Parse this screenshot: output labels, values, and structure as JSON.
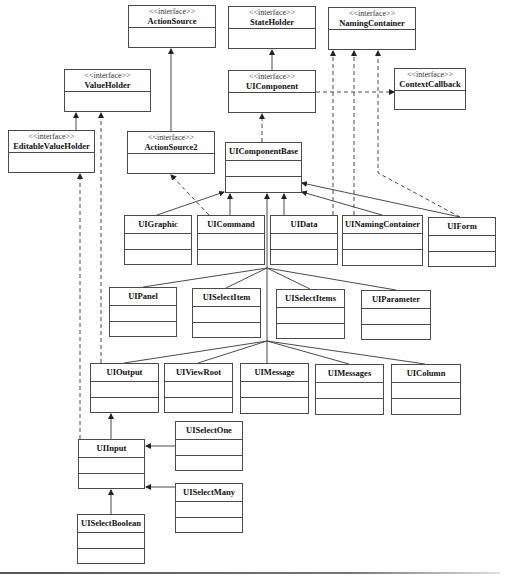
{
  "diagram": {
    "type": "uml-class-diagram",
    "stereotype_label": "<<interface>>",
    "colors": {
      "line": "#4a4a4a",
      "box_border": "#4a4a4a",
      "background": "#ffffff"
    },
    "classes": [
      {
        "id": "ActionSource",
        "name": "ActionSource",
        "interface": true,
        "x": 128,
        "y": 5,
        "w": 88,
        "h": 43
      },
      {
        "id": "StateHolder",
        "name": "StateHolder",
        "interface": true,
        "x": 228,
        "y": 6,
        "w": 88,
        "h": 43
      },
      {
        "id": "NamingContainer",
        "name": "NamingContainer",
        "interface": true,
        "x": 328,
        "y": 7,
        "w": 88,
        "h": 43
      },
      {
        "id": "ValueHolder",
        "name": "ValueHolder",
        "interface": true,
        "x": 64,
        "y": 69,
        "w": 87,
        "h": 43
      },
      {
        "id": "UIComponent",
        "name": "UIComponent",
        "interface": true,
        "x": 228,
        "y": 70,
        "w": 88,
        "h": 43
      },
      {
        "id": "ContextCallback",
        "name": "ContextCallback",
        "interface": true,
        "x": 394,
        "y": 68,
        "w": 72,
        "h": 42
      },
      {
        "id": "EditableValueHolder",
        "name": "EditableValueHolder",
        "interface": true,
        "x": 8,
        "y": 130,
        "w": 87,
        "h": 43
      },
      {
        "id": "ActionSource2",
        "name": "ActionSource2",
        "interface": true,
        "x": 127,
        "y": 131,
        "w": 88,
        "h": 43
      },
      {
        "id": "UIComponentBase",
        "name": "UIComponentBase",
        "interface": false,
        "x": 225,
        "y": 142,
        "w": 77,
        "h": 51
      },
      {
        "id": "UIGraphic",
        "name": "UIGraphic",
        "interface": false,
        "x": 124,
        "y": 215,
        "w": 68,
        "h": 50
      },
      {
        "id": "UICommand",
        "name": "UICommand",
        "interface": false,
        "x": 197,
        "y": 215,
        "w": 68,
        "h": 50
      },
      {
        "id": "UIData",
        "name": "UIData",
        "interface": false,
        "x": 270,
        "y": 215,
        "w": 68,
        "h": 50
      },
      {
        "id": "UINamingContainer",
        "name": "UINamingContainer",
        "interface": false,
        "x": 342,
        "y": 215,
        "w": 81,
        "h": 51
      },
      {
        "id": "UIForm",
        "name": "UIForm",
        "interface": false,
        "x": 428,
        "y": 217,
        "w": 68,
        "h": 50
      },
      {
        "id": "UIPanel",
        "name": "UIPanel",
        "interface": false,
        "x": 109,
        "y": 287,
        "w": 68,
        "h": 50
      },
      {
        "id": "UISelectItem",
        "name": "UISelectItem",
        "interface": false,
        "x": 192,
        "y": 288,
        "w": 69,
        "h": 50
      },
      {
        "id": "UISelectItems",
        "name": "UISelectItems",
        "interface": false,
        "x": 276,
        "y": 289,
        "w": 69,
        "h": 50
      },
      {
        "id": "UIParameter",
        "name": "UIParameter",
        "interface": false,
        "x": 361,
        "y": 290,
        "w": 70,
        "h": 50
      },
      {
        "id": "UIOutput",
        "name": "UIOutput",
        "interface": false,
        "x": 90,
        "y": 363,
        "w": 69,
        "h": 50
      },
      {
        "id": "UIViewRoot",
        "name": "UIViewRoot",
        "interface": false,
        "x": 164,
        "y": 363,
        "w": 69,
        "h": 50
      },
      {
        "id": "UIMessage",
        "name": "UIMessage",
        "interface": false,
        "x": 240,
        "y": 363,
        "w": 69,
        "h": 51
      },
      {
        "id": "UIMessages",
        "name": "UIMessages",
        "interface": false,
        "x": 315,
        "y": 364,
        "w": 69,
        "h": 51
      },
      {
        "id": "UIColumn",
        "name": "UIColumn",
        "interface": false,
        "x": 391,
        "y": 364,
        "w": 70,
        "h": 51
      },
      {
        "id": "UISelectOne",
        "name": "UISelectOne",
        "interface": false,
        "x": 175,
        "y": 421,
        "w": 68,
        "h": 50
      },
      {
        "id": "UIInput",
        "name": "UIInput",
        "interface": false,
        "x": 78,
        "y": 439,
        "w": 67,
        "h": 50
      },
      {
        "id": "UISelectMany",
        "name": "UISelectMany",
        "interface": false,
        "x": 175,
        "y": 483,
        "w": 68,
        "h": 50
      },
      {
        "id": "UISelectBoolean",
        "name": "UISelectBoolean",
        "interface": false,
        "x": 77,
        "y": 514,
        "w": 68,
        "h": 50
      }
    ],
    "relationships": [
      {
        "from": "StateHolder",
        "to": "UIComponent",
        "kind": "generalization",
        "style": "solid",
        "points": [
          [
            272,
            113
          ],
          [
            272,
            50
          ]
        ]
      },
      {
        "from": "UIComponent",
        "to": "ContextCallback",
        "kind": "realization",
        "style": "dashed",
        "points": [
          [
            316,
            92
          ],
          [
            394,
            92
          ]
        ]
      },
      {
        "from": "UIComponentBase",
        "to": "UIComponent",
        "kind": "realization",
        "style": "dashed",
        "points": [
          [
            262,
            142
          ],
          [
            262,
            114
          ]
        ]
      },
      {
        "from": "EditableValueHolder",
        "to": "ValueHolder",
        "kind": "generalization",
        "style": "solid",
        "points": [
          [
            76,
            130
          ],
          [
            76,
            113
          ]
        ]
      },
      {
        "from": "ActionSource2",
        "to": "ActionSource",
        "kind": "generalization",
        "style": "solid",
        "points": [
          [
            171,
            131
          ],
          [
            171,
            49
          ]
        ]
      },
      {
        "from": "UIOutput",
        "to": "ValueHolder",
        "kind": "realization",
        "style": "dashed",
        "points": [
          [
            101,
            363
          ],
          [
            101,
            113
          ]
        ]
      },
      {
        "from": "UIInput",
        "to": "EditableValueHolder",
        "kind": "realization",
        "style": "dashed",
        "points": [
          [
            80,
            439
          ],
          [
            80,
            174
          ]
        ]
      },
      {
        "from": "UICommand",
        "to": "ActionSource2",
        "kind": "realization",
        "style": "dashed",
        "points": [
          [
            209,
            215
          ],
          [
            171,
            175
          ]
        ]
      },
      {
        "from": "UIData",
        "to": "NamingContainer",
        "kind": "realization",
        "style": "dashed",
        "points": [
          [
            333,
            215
          ],
          [
            333,
            51
          ]
        ]
      },
      {
        "from": "UINamingContainer",
        "to": "NamingContainer",
        "kind": "realization",
        "style": "dashed",
        "points": [
          [
            354,
            215
          ],
          [
            354,
            51
          ]
        ]
      },
      {
        "from": "UIForm",
        "to": "NamingContainer",
        "kind": "realization",
        "style": "dashed",
        "points": [
          [
            460,
            217
          ],
          [
            378,
            173
          ],
          [
            378,
            51
          ]
        ]
      },
      {
        "from": "UIGraphic",
        "to": "UIComponentBase",
        "kind": "generalization",
        "style": "solid",
        "points": [
          [
            157,
            215
          ],
          [
            224,
            192
          ]
        ]
      },
      {
        "from": "UICommand",
        "to": "UIComponentBase",
        "kind": "generalization",
        "style": "solid",
        "points": [
          [
            230,
            215
          ],
          [
            230,
            194
          ]
        ]
      },
      {
        "from": "UIData",
        "to": "UIComponentBase",
        "kind": "generalization",
        "style": "solid",
        "points": [
          [
            284,
            215
          ],
          [
            284,
            194
          ]
        ]
      },
      {
        "from": "UINamingContainer",
        "to": "UIComponentBase",
        "kind": "generalization",
        "style": "solid",
        "points": [
          [
            382,
            215
          ],
          [
            302,
            192
          ]
        ]
      },
      {
        "from": "UIForm",
        "to": "UIComponentBase",
        "kind": "generalization",
        "style": "solid",
        "points": [
          [
            460,
            217
          ],
          [
            302,
            183
          ]
        ]
      },
      {
        "from": "trunk",
        "to": "UIComponentBase",
        "kind": "generalization",
        "style": "solid",
        "points": [
          [
            267,
            341
          ],
          [
            267,
            194
          ]
        ]
      },
      {
        "from": "UIPanel",
        "to": "trunk",
        "kind": "generalization",
        "style": "solid",
        "points": [
          [
            143,
            287
          ],
          [
            267,
            268
          ]
        ]
      },
      {
        "from": "UISelectItem",
        "to": "trunk",
        "kind": "generalization",
        "style": "solid",
        "points": [
          [
            226,
            288
          ],
          [
            267,
            268
          ]
        ]
      },
      {
        "from": "UISelectItems",
        "to": "trunk",
        "kind": "generalization",
        "style": "solid",
        "points": [
          [
            310,
            289
          ],
          [
            267,
            268
          ]
        ]
      },
      {
        "from": "UIParameter",
        "to": "trunk",
        "kind": "generalization",
        "style": "solid",
        "points": [
          [
            396,
            290
          ],
          [
            267,
            268
          ]
        ]
      },
      {
        "from": "UIOutput",
        "to": "trunk",
        "kind": "generalization",
        "style": "solid",
        "points": [
          [
            124,
            363
          ],
          [
            267,
            341
          ]
        ]
      },
      {
        "from": "UIViewRoot",
        "to": "trunk",
        "kind": "generalization",
        "style": "solid",
        "points": [
          [
            198,
            363
          ],
          [
            267,
            341
          ]
        ]
      },
      {
        "from": "UIMessage",
        "to": "trunk",
        "kind": "generalization",
        "style": "solid",
        "points": [
          [
            267,
            363
          ],
          [
            267,
            341
          ]
        ]
      },
      {
        "from": "UIMessages",
        "to": "trunk",
        "kind": "generalization",
        "style": "solid",
        "points": [
          [
            349,
            364
          ],
          [
            267,
            341
          ]
        ]
      },
      {
        "from": "UIColumn",
        "to": "trunk",
        "kind": "generalization",
        "style": "solid",
        "points": [
          [
            425,
            364
          ],
          [
            267,
            341
          ]
        ]
      },
      {
        "from": "UIInput",
        "to": "UIOutput",
        "kind": "generalization",
        "style": "solid",
        "points": [
          [
            111,
            439
          ],
          [
            111,
            414
          ]
        ]
      },
      {
        "from": "UISelectOne",
        "to": "UIInput",
        "kind": "generalization",
        "style": "solid",
        "points": [
          [
            175,
            446
          ],
          [
            146,
            446
          ]
        ]
      },
      {
        "from": "UISelectMany",
        "to": "UIInput",
        "kind": "generalization",
        "style": "solid",
        "points": [
          [
            175,
            487
          ],
          [
            146,
            487
          ]
        ]
      },
      {
        "from": "UISelectBoolean",
        "to": "UIInput",
        "kind": "generalization",
        "style": "solid",
        "points": [
          [
            111,
            514
          ],
          [
            111,
            490
          ]
        ]
      }
    ]
  }
}
